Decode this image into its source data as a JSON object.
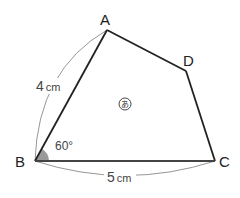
{
  "diagram": {
    "shape": "quadrilateral",
    "vertices": {
      "A": {
        "label": "A",
        "x": 107,
        "y": 30
      },
      "B": {
        "label": "B",
        "x": 35,
        "y": 161
      },
      "C": {
        "label": "C",
        "x": 215,
        "y": 161
      },
      "D": {
        "label": "D",
        "x": 186,
        "y": 71
      }
    },
    "measurements": {
      "AB": {
        "value": "4",
        "unit": "cm"
      },
      "BC": {
        "value": "5",
        "unit": "cm"
      }
    },
    "angle": {
      "vertex": "B",
      "label": "60°"
    },
    "region_label": "あ",
    "colors": {
      "edge": "#222222",
      "arc": "#8a8a8a",
      "angle_fill": "#9a9a9a",
      "background": "#ffffff"
    }
  }
}
